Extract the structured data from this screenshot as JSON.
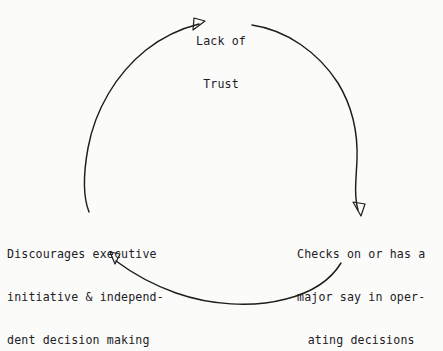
{
  "diagram": {
    "type": "cycle-diagram",
    "background_color": "#fbfbfa",
    "stroke_color": "#1f1d1c",
    "text_color": "#22201f",
    "circle": {
      "center_x": 220,
      "center_y": 162,
      "radius": 135
    },
    "nodes": [
      {
        "id": "lack-of-trust",
        "position": "top",
        "align": "center",
        "lines": [
          "Lack of",
          "Trust"
        ]
      },
      {
        "id": "checks-on-operating-decisions",
        "position": "right",
        "align": "center",
        "lines": [
          "Checks on or has a",
          "major say in oper-",
          "ating decisions"
        ]
      },
      {
        "id": "discourages-initiative",
        "position": "left",
        "align": "left",
        "lines": [
          "Discourages executive",
          "initiative & independ-",
          "dent decision making"
        ]
      }
    ],
    "arrows": [
      {
        "id": "arrow-to-lack-of-trust",
        "from": "discourages-initiative",
        "to": "lack-of-trust",
        "direction": "up-right",
        "style": "open-outline"
      },
      {
        "id": "arrow-to-checks-on",
        "from": "lack-of-trust",
        "to": "checks-on-operating-decisions",
        "direction": "down-right",
        "style": "open-outline"
      },
      {
        "id": "arrow-to-discourages",
        "from": "checks-on-operating-decisions",
        "to": "discourages-initiative",
        "direction": "up-left",
        "style": "open-outline"
      }
    ]
  }
}
